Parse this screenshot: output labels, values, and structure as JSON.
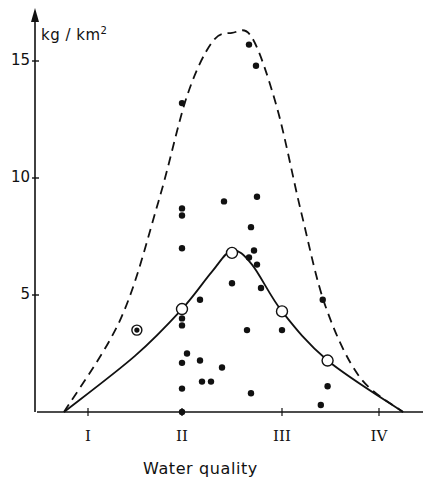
{
  "chart_data": {
    "type": "scatter",
    "title": "",
    "xlabel": "Water quality",
    "ylabel": "kg / km",
    "ylabel_sup": "2",
    "x_categories": [
      "I",
      "II",
      "III",
      "IV"
    ],
    "y_ticks": [
      5,
      10,
      15
    ],
    "ylim": [
      0,
      17
    ],
    "grid": false,
    "legend": null,
    "series": [
      {
        "name": "observations",
        "kind": "points",
        "marker": "filled-circle",
        "points": [
          {
            "x": 2.0,
            "y": 13.2
          },
          {
            "x": 2.0,
            "y": 8.7
          },
          {
            "x": 2.0,
            "y": 8.4
          },
          {
            "x": 2.0,
            "y": 7.0
          },
          {
            "x": 2.0,
            "y": 4.0
          },
          {
            "x": 2.0,
            "y": 3.7
          },
          {
            "x": 2.0,
            "y": 2.1
          },
          {
            "x": 2.0,
            "y": 1.0
          },
          {
            "x": 2.0,
            "y": 0.0
          },
          {
            "x": 2.05,
            "y": 2.5
          },
          {
            "x": 2.18,
            "y": 4.8
          },
          {
            "x": 2.18,
            "y": 2.2
          },
          {
            "x": 2.2,
            "y": 1.3
          },
          {
            "x": 2.29,
            "y": 1.3
          },
          {
            "x": 2.4,
            "y": 1.9
          },
          {
            "x": 2.42,
            "y": 9.0
          },
          {
            "x": 2.5,
            "y": 5.5
          },
          {
            "x": 2.67,
            "y": 15.7
          },
          {
            "x": 2.74,
            "y": 14.8
          },
          {
            "x": 2.75,
            "y": 9.2
          },
          {
            "x": 2.69,
            "y": 7.9
          },
          {
            "x": 2.67,
            "y": 6.6
          },
          {
            "x": 2.72,
            "y": 6.9
          },
          {
            "x": 2.75,
            "y": 6.3
          },
          {
            "x": 2.79,
            "y": 5.3
          },
          {
            "x": 2.65,
            "y": 3.5
          },
          {
            "x": 2.69,
            "y": 0.8
          },
          {
            "x": 3.0,
            "y": 3.5
          },
          {
            "x": 3.42,
            "y": 4.8
          },
          {
            "x": 3.47,
            "y": 1.1
          },
          {
            "x": 3.4,
            "y": 0.3
          }
        ]
      },
      {
        "name": "mean",
        "kind": "points",
        "marker": "open-circle",
        "points": [
          {
            "x": 2.0,
            "y": 4.4
          },
          {
            "x": 2.5,
            "y": 6.8
          },
          {
            "x": 3.0,
            "y": 4.3
          },
          {
            "x": 3.47,
            "y": 2.2
          }
        ]
      },
      {
        "name": "special",
        "kind": "points",
        "marker": "ringed-dot",
        "points": [
          {
            "x": 1.52,
            "y": 3.5
          }
        ]
      },
      {
        "name": "mean curve",
        "kind": "line",
        "style": "solid",
        "points": [
          {
            "x": 0.75,
            "y": 0
          },
          {
            "x": 1.5,
            "y": 2.4
          },
          {
            "x": 2.0,
            "y": 4.4
          },
          {
            "x": 2.3,
            "y": 6.0
          },
          {
            "x": 2.5,
            "y": 6.9
          },
          {
            "x": 2.7,
            "y": 6.3
          },
          {
            "x": 3.0,
            "y": 4.3
          },
          {
            "x": 3.47,
            "y": 2.2
          },
          {
            "x": 4.25,
            "y": 0
          }
        ]
      },
      {
        "name": "upper envelope",
        "kind": "line",
        "style": "dashed",
        "points": [
          {
            "x": 0.75,
            "y": 0
          },
          {
            "x": 1.35,
            "y": 4.0
          },
          {
            "x": 1.75,
            "y": 9.0
          },
          {
            "x": 2.05,
            "y": 13.5
          },
          {
            "x": 2.3,
            "y": 15.8
          },
          {
            "x": 2.5,
            "y": 16.2
          },
          {
            "x": 2.7,
            "y": 16.0
          },
          {
            "x": 2.95,
            "y": 13.0
          },
          {
            "x": 3.2,
            "y": 8.5
          },
          {
            "x": 3.45,
            "y": 4.5
          },
          {
            "x": 3.8,
            "y": 1.5
          },
          {
            "x": 4.25,
            "y": 0
          }
        ]
      }
    ]
  },
  "labels": {
    "ylabel": "kg / km",
    "ylabel_sup": "2",
    "xlabel": "Water quality",
    "yticks": [
      "15",
      "10",
      "5"
    ],
    "xticks": [
      "I",
      "II",
      "III",
      "IV"
    ]
  }
}
